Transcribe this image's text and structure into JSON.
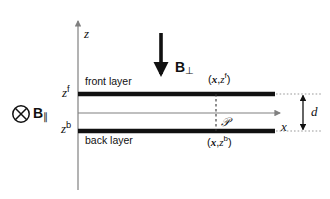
{
  "figure": {
    "background_color": "#ffffff",
    "line_color": "#111111",
    "axis_color": "#808080",
    "width": 330,
    "height": 199
  },
  "axes": {
    "z_label": "z",
    "x_label": "x"
  },
  "levels": {
    "front_level_base": "z",
    "front_level_sup": "f",
    "back_level_base": "z",
    "back_level_sup": "b"
  },
  "layers": {
    "front_label": "front layer",
    "back_label": "back layer"
  },
  "fields": {
    "perpendicular_base": "B",
    "perpendicular_sub": "⊥",
    "parallel_base": "B",
    "parallel_sub": "∥",
    "parallel_icon": "circle-cross-into-page-icon"
  },
  "points": {
    "front_open": "(",
    "front_x": "x",
    "front_comma": ",",
    "front_z": "z",
    "front_sup": "f",
    "front_close": ")",
    "back_open": "(",
    "back_x": "x",
    "back_comma": ",",
    "back_z": "z",
    "back_sup": "b",
    "back_close": ")",
    "probe_label": "𝒫"
  },
  "dimensions": {
    "separation_label": "d"
  }
}
